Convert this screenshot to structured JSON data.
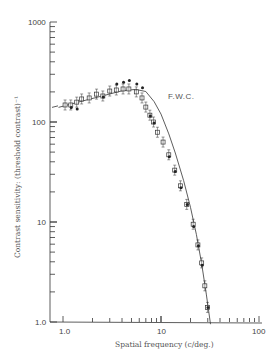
{
  "chart_data": {
    "type": "scatter",
    "title": "",
    "xlabel": "Spatial frequency (c/deg.)",
    "ylabel": "Contrast sensitivity: (threshold contrast)⁻¹",
    "xscale": "log",
    "yscale": "log",
    "xlim": [
      1.0,
      100
    ],
    "ylim": [
      1.0,
      1000
    ],
    "x_tick_labels": [
      "1.0",
      "10",
      "100"
    ],
    "y_tick_labels": [
      "1.0",
      "10",
      "100",
      "1000"
    ],
    "grid": false,
    "legend": null,
    "annotations": [
      {
        "text": "F.W.C.",
        "x": 11,
        "y": 200
      }
    ],
    "series": [
      {
        "name": "measured (open squares/circles)",
        "marker": "open",
        "x": [
          1.05,
          1.2,
          1.38,
          1.55,
          1.85,
          2.2,
          2.55,
          3.0,
          3.5,
          4.1,
          4.7,
          5.6,
          6.4,
          7.0,
          7.7,
          8.4,
          9.2,
          10.5,
          12.0,
          13.8,
          15.8,
          18.3,
          21.3,
          23.8,
          26.0,
          28.0,
          29.8
        ],
        "y": [
          148,
          148,
          158,
          170,
          174,
          190,
          182,
          204,
          209,
          214,
          214,
          200,
          174,
          141,
          117,
          100,
          79,
          63,
          47,
          33,
          23,
          15,
          9.5,
          5.9,
          3.9,
          2.3,
          1.4
        ]
      },
      {
        "name": "measured (filled)",
        "marker": "filled",
        "x": [
          1.2,
          1.38,
          2.55,
          3.5,
          4.1,
          4.7,
          5.6,
          6.4,
          7.7,
          8.4,
          12.0,
          13.8,
          15.8,
          18.3,
          21.3,
          23.8,
          26.0,
          29.8
        ],
        "y": [
          140,
          135,
          178,
          240,
          250,
          260,
          240,
          220,
          115,
          98,
          45,
          32,
          22,
          15,
          9,
          5.8,
          3.7,
          1.4
        ]
      }
    ],
    "fit_curve": {
      "name": "fitted curve",
      "x": [
        0.9,
        1.5,
        2.5,
        4,
        5.5,
        7,
        8.5,
        10,
        12,
        14,
        17,
        20,
        23,
        26,
        29,
        32
      ],
      "y": [
        140,
        160,
        182,
        205,
        212,
        202,
        160,
        120,
        76,
        49,
        26,
        14,
        7.5,
        3.8,
        1.9,
        0.95
      ]
    }
  }
}
